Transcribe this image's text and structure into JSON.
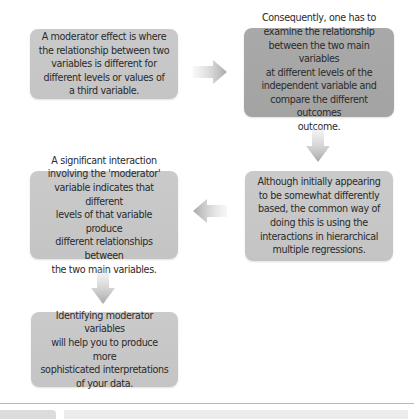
{
  "diagram": {
    "type": "flowchart",
    "boxes": [
      {
        "id": "box1",
        "text": "A moderator effect is where\nthe relationship between two\nvariables is different for\ndifferent levels or values of\na third variable."
      },
      {
        "id": "box2",
        "text": "Consequently, one has to\nexamine the relationship\nbetween the two main variables\nat different levels of the\nindependent variable and\ncompare the different outcomes\noutcome."
      },
      {
        "id": "box3",
        "text": "Although initially appearing\nto be somewhat differently\nbased, the common way of\ndoing this is using the\ninteractions in hierarchical\nmultiple regressions."
      },
      {
        "id": "box4",
        "text": "A significant interaction\ninvolving the 'moderator'\nvariable indicates that different\nlevels of that variable produce\ndifferent relationships between\nthe two main variables."
      },
      {
        "id": "box5",
        "text": "Identifying moderator variables\nwill help you to produce more\nsophisticated interpretations\nof your data."
      }
    ],
    "arrows": [
      {
        "from": "box1",
        "to": "box2",
        "direction": "right",
        "icon": "arrow-right-icon"
      },
      {
        "from": "box2",
        "to": "box3",
        "direction": "down",
        "icon": "arrow-down-icon"
      },
      {
        "from": "box3",
        "to": "box4",
        "direction": "left",
        "icon": "arrow-left-icon"
      },
      {
        "from": "box4",
        "to": "box5",
        "direction": "down",
        "icon": "arrow-down-icon"
      }
    ],
    "colors": {
      "box_dark": "#a6a6a6",
      "box_light": "#c7c7c7",
      "arrow": "#a8a8a8",
      "text": "#2a2a2a"
    }
  }
}
